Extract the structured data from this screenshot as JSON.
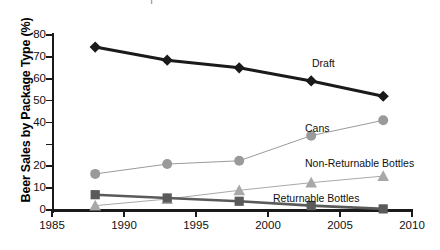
{
  "chart_data": {
    "type": "line",
    "title": "",
    "xlabel": "",
    "ylabel": "Beer Sales by Package Type (%)",
    "xlim": [
      1985,
      2010
    ],
    "ylim": [
      0,
      80
    ],
    "x": [
      1988,
      1993,
      1998,
      2003,
      2008
    ],
    "xticks": [
      "1985",
      "1990",
      "1995",
      "2000",
      "2005",
      "2010"
    ],
    "xtick_values": [
      1985,
      1990,
      1995,
      2000,
      2005,
      2010
    ],
    "yticks": [
      "0",
      "10",
      "20",
      "",
      "40",
      "50",
      "60",
      "70",
      "80"
    ],
    "ytick_values": [
      0,
      10,
      20,
      30,
      40,
      50,
      60,
      70,
      80
    ],
    "grid": false,
    "legend_position": "inline-annotations",
    "series": [
      {
        "name": "Draft",
        "color": "#1a1a1a",
        "marker": "diamond",
        "line_width": 3,
        "values": [
          74.5,
          68.5,
          65.0,
          59.0,
          52.0
        ]
      },
      {
        "name": "Cans",
        "color": "#9a9a9a",
        "marker": "circle",
        "line_width": 1,
        "values": [
          16.5,
          21.0,
          22.5,
          34.0,
          41.0
        ]
      },
      {
        "name": "Non-Returnable Bottles",
        "color": "#a8a8a8",
        "marker": "triangle",
        "line_width": 1,
        "values": [
          2.0,
          5.0,
          9.0,
          12.5,
          15.5
        ]
      },
      {
        "name": "Returnable Bottles",
        "color": "#5a5a5a",
        "marker": "square",
        "line_width": 2.6,
        "values": [
          7.0,
          5.5,
          4.0,
          2.0,
          0.5
        ]
      }
    ],
    "annotations": [
      {
        "text": "Draft",
        "x": 312,
        "y": 57
      },
      {
        "text": "Cans",
        "x": 305,
        "y": 122
      },
      {
        "text": "Non-Returnable Bottles",
        "x": 305,
        "y": 157
      },
      {
        "text": "Returnable Bottles",
        "x": 273,
        "y": 192
      }
    ],
    "top_partial_text": "Ι"
  }
}
